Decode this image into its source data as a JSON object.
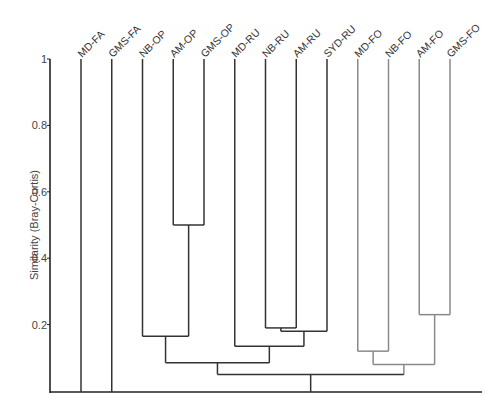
{
  "chart_data": {
    "type": "dendrogram",
    "title": "",
    "xlabel": "",
    "ylabel": "Similarity (Bray-Curtis)",
    "ylim": [
      0,
      1
    ],
    "yticks": [
      {
        "value": 1,
        "label": "1"
      },
      {
        "value": 0.8,
        "label": "0.8"
      },
      {
        "value": 0.6,
        "label": "0.6"
      },
      {
        "value": 0.4,
        "label": "0.4"
      },
      {
        "value": 0.2,
        "label": "0.2"
      }
    ],
    "leaves": [
      {
        "label": "MD-FA",
        "color": "#333333"
      },
      {
        "label": "GMS-FA",
        "color": "#333333"
      },
      {
        "label": "NB-OP",
        "color": "#333333"
      },
      {
        "label": "AM-OP",
        "color": "#333333"
      },
      {
        "label": "GMS-OP",
        "color": "#333333"
      },
      {
        "label": "MD-RU",
        "color": "#333333"
      },
      {
        "label": "NB-RU",
        "color": "#333333"
      },
      {
        "label": "AM-RU",
        "color": "#333333"
      },
      {
        "label": "SYD-RU",
        "color": "#333333"
      },
      {
        "label": "MD-FO",
        "color": "#8a8a8a"
      },
      {
        "label": "NB-FO",
        "color": "#8a8a8a"
      },
      {
        "label": "AM-FO",
        "color": "#8a8a8a"
      },
      {
        "label": "GMS-FO",
        "color": "#8a8a8a"
      }
    ],
    "merges": [
      {
        "id": "c1",
        "children": [
          "AM-OP",
          "GMS-OP"
        ],
        "similarity": 0.5
      },
      {
        "id": "c2",
        "children": [
          "NB-OP",
          "c1"
        ],
        "similarity": 0.165
      },
      {
        "id": "c3",
        "children": [
          "NB-RU",
          "AM-RU"
        ],
        "similarity": 0.19
      },
      {
        "id": "c4",
        "children": [
          "c3",
          "SYD-RU"
        ],
        "similarity": 0.18
      },
      {
        "id": "c5",
        "children": [
          "MD-RU",
          "c4"
        ],
        "similarity": 0.135
      },
      {
        "id": "c6",
        "children": [
          "c2",
          "c5"
        ],
        "similarity": 0.085
      },
      {
        "id": "c7",
        "children": [
          "MD-FO",
          "NB-FO"
        ],
        "similarity": 0.12
      },
      {
        "id": "c8",
        "children": [
          "AM-FO",
          "GMS-FO"
        ],
        "similarity": 0.23
      },
      {
        "id": "c9",
        "children": [
          "c7",
          "c8"
        ],
        "similarity": 0.08
      },
      {
        "id": "c10",
        "children": [
          "c6",
          "c9"
        ],
        "similarity": 0.05
      },
      {
        "id": "root",
        "children": [
          "MD-FA",
          "GMS-FA",
          "c10"
        ],
        "similarity": 0.0
      }
    ],
    "colors": {
      "main_branches": "#333333",
      "fo_cluster_branches": "#8a8a8a",
      "axis": "#222222"
    },
    "legend": null,
    "grid": false
  }
}
